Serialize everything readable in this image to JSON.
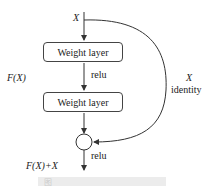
{
  "diagram": {
    "input_label": "X",
    "layer1": "Weight layer",
    "layer2": "Weight layer",
    "relu1": "relu",
    "relu2": "relu",
    "residual_label": "F(X)",
    "shortcut_label": "X",
    "shortcut_name": "identity",
    "output_label": "F(X)+X",
    "caption": "图"
  },
  "colors": {
    "line": "#333333",
    "box_border": "#444444"
  }
}
